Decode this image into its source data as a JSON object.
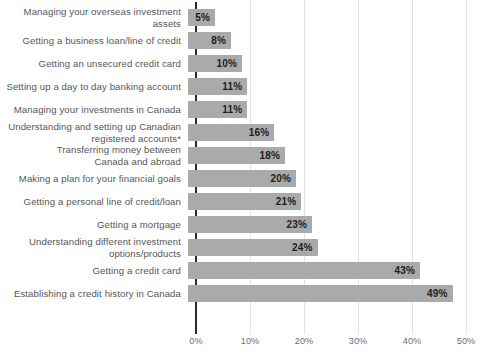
{
  "chart_data": {
    "type": "bar",
    "orientation": "horizontal",
    "title": "",
    "subtitle": "",
    "xlabel": "",
    "ylabel": "",
    "xlim": [
      0,
      50
    ],
    "grid": "vertical",
    "legend": "none",
    "value_suffix": "%",
    "bar_color": "#aaaaaa",
    "axis_color": "#2b2b2b",
    "grid_color": "#e3e3e3",
    "label_color": "#56565a",
    "value_label_color": "#1c1c1c",
    "x_ticks": [
      {
        "value": 0,
        "label": "0%"
      },
      {
        "value": 10,
        "label": "10%"
      },
      {
        "value": 20,
        "label": "20%"
      },
      {
        "value": 30,
        "label": "30%"
      },
      {
        "value": 40,
        "label": "40%"
      },
      {
        "value": 50,
        "label": "50%"
      }
    ],
    "categories": [
      "Managing your overseas investment assets",
      "Getting a business loan/line of credit",
      "Getting an unsecured credit card",
      "Setting up a day to day banking account",
      "Managing your investments in Canada",
      "Understanding and setting up Canadian\nregistered accounts*",
      "Transferring money between\nCanada and abroad",
      "Making a plan for your financial goals",
      "Getting a personal line of credit/loan",
      "Getting a mortgage",
      "Understanding different investment\noptions/products",
      "Getting a credit card",
      "Establishing a credit history in Canada"
    ],
    "values": [
      5,
      8,
      10,
      11,
      11,
      16,
      18,
      20,
      21,
      23,
      24,
      43,
      49
    ],
    "value_labels": [
      "5%",
      "8%",
      "10%",
      "11%",
      "11%",
      "16%",
      "18%",
      "20%",
      "21%",
      "23%",
      "24%",
      "43%",
      "49%"
    ]
  }
}
